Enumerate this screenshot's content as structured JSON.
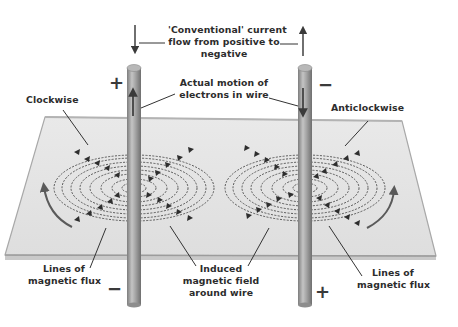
{
  "diagram": {
    "labels": {
      "conventional_line1": "'Conventional' current",
      "conventional_line2": "flow from positive to",
      "conventional_line3": "negative",
      "electrons_line1": "Actual motion of",
      "electrons_line2": "electrons in wire",
      "clockwise": "Clockwise",
      "anticlockwise": "Anticlockwise",
      "flux_left_line1": "Lines of",
      "flux_left_line2": "magnetic flux",
      "induced_line1": "Induced",
      "induced_line2": "magnetic field",
      "induced_line3": "around wire",
      "flux_right_line1": "Lines of",
      "flux_right_line2": "magnetic flux"
    },
    "signs": {
      "left_top": "+",
      "left_bottom": "−",
      "right_top": "−",
      "right_bottom": "+"
    },
    "wires": [
      {
        "name": "left-wire",
        "top_terminal": "+",
        "bottom_terminal": "−",
        "field_direction": "Clockwise",
        "electron_arrow": "up",
        "conventional_arrow": "down"
      },
      {
        "name": "right-wire",
        "top_terminal": "−",
        "bottom_terminal": "+",
        "field_direction": "Anticlockwise",
        "electron_arrow": "down",
        "conventional_arrow": "up"
      }
    ],
    "colors": {
      "plane": "#e3e3e3",
      "plane_edge": "#a9a9a9",
      "wire": "#9b9b9b",
      "flux_lines": "#3a3a3a",
      "text": "#2c2c2c"
    }
  }
}
